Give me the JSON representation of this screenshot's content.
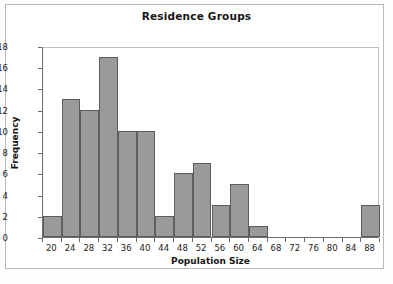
{
  "figure": {
    "title": "Residence Groups",
    "background_color": "#ffffff",
    "frame_color": "#b9b9b9"
  },
  "chart_data": {
    "type": "bar",
    "title": "Residence Groups",
    "xlabel": "Population Size",
    "ylabel": "Frequency",
    "categories": [
      20,
      24,
      28,
      32,
      36,
      40,
      44,
      48,
      52,
      56,
      60,
      64,
      68,
      72,
      76,
      80,
      84,
      88
    ],
    "values": [
      2,
      13,
      12,
      17,
      10,
      10,
      2,
      6,
      7,
      3,
      5,
      1,
      0,
      0,
      0,
      0,
      0,
      3
    ],
    "xtick_labels": [
      "20",
      "24",
      "28",
      "32",
      "36",
      "40",
      "44",
      "48",
      "52",
      "56",
      "60",
      "64",
      "68",
      "72",
      "76",
      "80",
      "84",
      "88"
    ],
    "ytick_labels": [
      "0",
      "2",
      "4",
      "6",
      "8",
      "10",
      "12",
      "14",
      "16",
      "18"
    ],
    "ytick_values": [
      0,
      2,
      4,
      6,
      8,
      10,
      12,
      14,
      16,
      18
    ],
    "ylim": [
      0,
      18
    ],
    "bin_width": 4,
    "grid": false,
    "legend": false,
    "bar_fill_color": "#9a9a9a",
    "bar_border_color": "#5d5d5d",
    "axis_color": "#6d6d6d"
  }
}
